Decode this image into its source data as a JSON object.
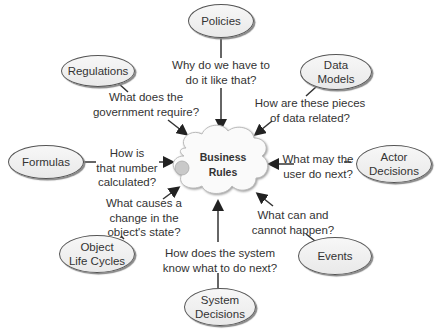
{
  "center": {
    "label": "Business\nRules",
    "shape": "cloud"
  },
  "nodes": [
    {
      "id": "policies",
      "label": "Policies",
      "question": "Why do we have to\ndo it like that?"
    },
    {
      "id": "regulations",
      "label": "Regulations",
      "question": "What does the\ngovernment require?"
    },
    {
      "id": "data-models",
      "label": "Data\nModels",
      "question": "How are these pieces\nof data related?"
    },
    {
      "id": "formulas",
      "label": "Formulas",
      "question": "How is\nthat number\ncalculated?"
    },
    {
      "id": "actor-decisions",
      "label": "Actor\nDecisions",
      "question": "What may the\nuser do next?"
    },
    {
      "id": "object-life-cycles",
      "label": "Object\nLife Cycles",
      "question": "What causes a\nchange in the\nobject's state?"
    },
    {
      "id": "events",
      "label": "Events",
      "question": "What can and\ncannot happen?"
    },
    {
      "id": "system-decisions",
      "label": "System\nDecisions",
      "question": "How does the system\nknow what to do next?"
    }
  ],
  "colors": {
    "line": "#333333",
    "node_fill": "#eeeeee",
    "cloud_fill": "#ffffff"
  }
}
